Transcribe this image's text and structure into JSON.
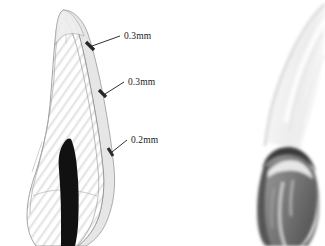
{
  "figure": {
    "type": "dental-illustration",
    "background_color": "#ffffff",
    "panels": [
      {
        "id": "left-panel",
        "name": "tooth-cross-section-diagram",
        "description": "Line-art cross section of a prepared tooth with layered facing and pulp canal",
        "style": "hatched line drawing"
      },
      {
        "id": "right-panel",
        "name": "tooth-clinical-photograph",
        "description": "Grayscale photograph of a prepared tooth abutment",
        "style": "greyscale photograph"
      }
    ],
    "callouts": [
      {
        "id": "callout-1",
        "label": "0.3mm",
        "text_x": 126,
        "text_y": 40,
        "tick_x": 88,
        "tick_y": 47
      },
      {
        "id": "callout-2",
        "label": "0.3mm",
        "text_x": 128,
        "text_y": 85,
        "tick_x": 101,
        "tick_y": 96
      },
      {
        "id": "callout-3",
        "label": "0.2mm",
        "text_x": 131,
        "text_y": 143,
        "tick_x": 110,
        "tick_y": 153
      }
    ],
    "colors": {
      "label_text": "#1a1a1a",
      "leader_line": "#1a1a1a",
      "tick_mark": "#2b2b2b",
      "outline": "#888888",
      "inner_outline": "#9a9a9a",
      "enamel_fill": "#f3f3f3",
      "dentin_fill": "#fafafa",
      "facing_fill": "#e9e9e9",
      "pulp_canal": "#000000",
      "hatching": "#e2e2e2",
      "photo_light": "#f2f2f2",
      "photo_mid": "#a8a8a8",
      "photo_dark": "#595959",
      "photo_darkest": "#3c3c3c"
    }
  }
}
